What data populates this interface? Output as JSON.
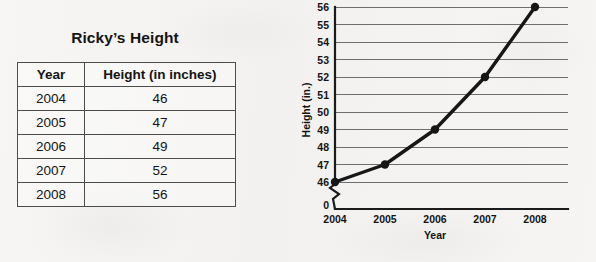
{
  "table": {
    "title": "Ricky’s Height",
    "columns": [
      "Year",
      "Height (in inches)"
    ],
    "rows": [
      {
        "year": "2004",
        "height": "46"
      },
      {
        "year": "2005",
        "height": "47"
      },
      {
        "year": "2006",
        "height": "49"
      },
      {
        "year": "2007",
        "height": "52"
      },
      {
        "year": "2008",
        "height": "56"
      }
    ]
  },
  "chart_data": {
    "type": "line",
    "title": "",
    "xlabel": "Year",
    "ylabel": "Height (in.)",
    "categories": [
      "2004",
      "2005",
      "2006",
      "2007",
      "2008"
    ],
    "values": [
      46,
      47,
      49,
      52,
      56
    ],
    "x_tick_labels": [
      "2004",
      "2005",
      "2006",
      "2007",
      "2008"
    ],
    "y_tick_labels": [
      "0",
      "46",
      "47",
      "48",
      "49",
      "50",
      "51",
      "52",
      "53",
      "54",
      "55",
      "56"
    ],
    "ylim": [
      46,
      56
    ],
    "y_axis_broken": true,
    "y_axis_break_between": [
      0,
      46
    ],
    "grid": true,
    "grid_axis": "y",
    "legend": "none",
    "marker": "filled-circle",
    "line_color": "#161616",
    "grid_color": "#6e6e6e"
  },
  "colors": {
    "background": "#f6f5f3",
    "text": "#141414",
    "table_border": "#4c4c4c",
    "axis": "#1b1b1b"
  }
}
